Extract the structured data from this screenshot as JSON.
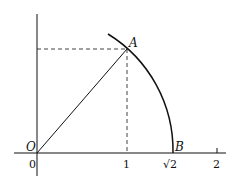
{
  "diagram": {
    "title": "",
    "points": {
      "origin": {
        "label": "O",
        "x": 0,
        "y": 0
      },
      "A": {
        "label": "A",
        "x": 1,
        "y": 1
      },
      "B": {
        "label": "B",
        "x": 1.4142,
        "y": 0
      }
    },
    "x_ticks": [
      {
        "value": 0,
        "label": "0"
      },
      {
        "value": 1,
        "label": "1"
      },
      {
        "value": 1.4142,
        "label": "√2"
      },
      {
        "value": 2,
        "label": "2"
      }
    ],
    "elements": [
      "x-axis",
      "y-axis",
      "segment OA",
      "arc of circle radius √2 through A and B",
      "dashed vertical from A to x=1",
      "dashed horizontal from A to y-axis"
    ],
    "colors": {
      "ink": "#111111",
      "background": "#ffffff"
    }
  }
}
